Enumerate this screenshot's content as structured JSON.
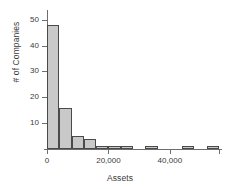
{
  "chart_data": {
    "type": "bar",
    "title": "",
    "subtitle": "",
    "xlabel": "Assets",
    "ylabel": "# of Companies",
    "grid": false,
    "legend": false,
    "legend_position": "none",
    "bin_width": 4000,
    "xlim": [
      0,
      56000
    ],
    "ylim": [
      0,
      53
    ],
    "x_ticks": [
      0,
      20000,
      40000
    ],
    "x_tick_labels": [
      "0",
      "20,000",
      "40,000"
    ],
    "y_ticks": [
      10,
      20,
      30,
      40,
      50
    ],
    "y_tick_labels": [
      "10",
      "20",
      "30",
      "40",
      "50"
    ],
    "bin_starts": [
      0,
      4000,
      8000,
      12000,
      16000,
      20000,
      24000,
      28000,
      32000,
      36000,
      40000,
      44000,
      48000,
      52000
    ],
    "values": [
      48,
      16,
      5,
      4,
      1,
      1,
      1,
      0,
      1,
      0,
      0,
      1,
      0,
      1
    ],
    "colors": {
      "bar_fill": "#c9c9c9",
      "bar_edge": "#4a4a4a",
      "axis": "#6e6e6e",
      "text": "#3a3a3a",
      "background": "#ffffff"
    }
  }
}
